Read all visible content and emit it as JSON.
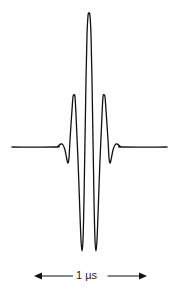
{
  "diagram": {
    "title": "",
    "waveform": {
      "type": "wavelet pulse",
      "description": "Symmetric oscillating pulse with a tall central positive peak, two deep negative troughs, two side positive peaks, and small ripples decaying to a flat baseline",
      "stroke_color": "#111111",
      "baseline_y": 147,
      "x_start": 12,
      "x_end": 167,
      "center_x": 89,
      "points": [
        [
          12,
          147
        ],
        [
          55,
          147
        ],
        [
          58,
          146
        ],
        [
          61,
          144
        ],
        [
          63,
          145
        ],
        [
          65,
          150
        ],
        [
          67,
          160
        ],
        [
          68,
          163
        ],
        [
          69,
          158
        ],
        [
          70,
          140
        ],
        [
          72,
          110
        ],
        [
          73,
          97
        ],
        [
          74,
          95
        ],
        [
          75,
          97
        ],
        [
          76,
          115
        ],
        [
          78,
          160
        ],
        [
          80,
          215
        ],
        [
          81,
          240
        ],
        [
          82,
          251
        ],
        [
          83,
          240
        ],
        [
          84,
          200
        ],
        [
          85,
          140
        ],
        [
          86,
          80
        ],
        [
          87,
          35
        ],
        [
          88,
          16
        ],
        [
          89,
          13
        ],
        [
          90,
          16
        ],
        [
          91,
          35
        ],
        [
          92,
          80
        ],
        [
          93,
          140
        ],
        [
          94,
          200
        ],
        [
          95,
          240
        ],
        [
          96,
          251
        ],
        [
          97,
          240
        ],
        [
          98,
          215
        ],
        [
          100,
          160
        ],
        [
          102,
          115
        ],
        [
          103,
          97
        ],
        [
          104,
          95
        ],
        [
          105,
          97
        ],
        [
          106,
          110
        ],
        [
          108,
          140
        ],
        [
          109,
          158
        ],
        [
          110,
          163
        ],
        [
          111,
          160
        ],
        [
          113,
          150
        ],
        [
          115,
          145
        ],
        [
          117,
          144
        ],
        [
          120,
          146
        ],
        [
          123,
          147
        ],
        [
          167,
          147
        ]
      ]
    },
    "scale_bar": {
      "label": "1 µs",
      "x_start": 34,
      "x_end": 147,
      "y": 276,
      "arrow_left": "left-arrowhead",
      "arrow_right": "right-arrowhead",
      "color": "#111111"
    }
  }
}
